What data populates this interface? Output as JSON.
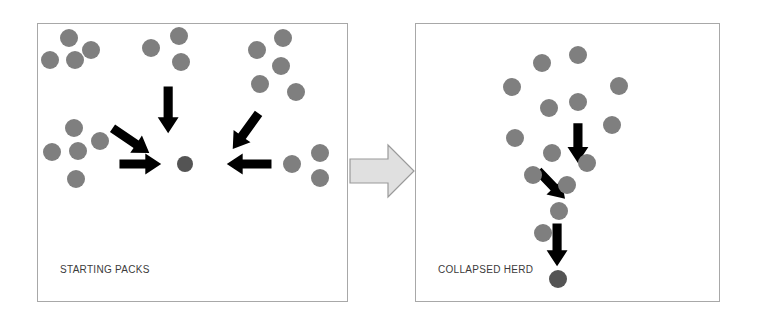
{
  "figure": {
    "type": "diagram",
    "background_color": "#ffffff",
    "dot_color": "#7f7f7f",
    "dark_dot_color": "#545454",
    "arrow_color": "#000000",
    "panel_border_color": "#a8a8a8",
    "transition_arrow_fill": "#e0e0e0",
    "transition_arrow_stroke": "#9a9a9a"
  },
  "panels": {
    "left": {
      "label": "STARTING PACKS",
      "packs": [
        {
          "name": "top-left-pack",
          "count": 4,
          "dots": [
            {
              "x": 31,
              "y": 14,
              "r": 9
            },
            {
              "x": 53,
              "y": 26,
              "r": 9
            },
            {
              "x": 12,
              "y": 36,
              "r": 9
            },
            {
              "x": 37,
              "y": 36,
              "r": 9
            }
          ]
        },
        {
          "name": "top-middle-pack",
          "count": 3,
          "dots": [
            {
              "x": 113,
              "y": 24,
              "r": 9
            },
            {
              "x": 141,
              "y": 12,
              "r": 9
            },
            {
              "x": 143,
              "y": 38,
              "r": 9
            }
          ]
        },
        {
          "name": "top-right-pack",
          "count": 5,
          "dots": [
            {
              "x": 219,
              "y": 26,
              "r": 9
            },
            {
              "x": 245,
              "y": 14,
              "r": 9
            },
            {
              "x": 243,
              "y": 42,
              "r": 9
            },
            {
              "x": 222,
              "y": 60,
              "r": 9
            },
            {
              "x": 258,
              "y": 68,
              "r": 9
            }
          ]
        },
        {
          "name": "bottom-left-pack",
          "count": 5,
          "dots": [
            {
              "x": 36,
              "y": 104,
              "r": 9
            },
            {
              "x": 62,
              "y": 117,
              "r": 9
            },
            {
              "x": 14,
              "y": 128,
              "r": 9
            },
            {
              "x": 40,
              "y": 127,
              "r": 9
            },
            {
              "x": 38,
              "y": 155,
              "r": 9
            }
          ]
        },
        {
          "name": "right-middle-pack",
          "count": 3,
          "dots": [
            {
              "x": 254,
              "y": 140,
              "r": 9
            },
            {
              "x": 282,
              "y": 129,
              "r": 9
            },
            {
              "x": 282,
              "y": 154,
              "r": 9
            }
          ]
        }
      ],
      "center_dot": {
        "x": 147,
        "y": 140,
        "r": 8
      },
      "arrows": [
        {
          "name": "arrow-top-left",
          "x1": 75,
          "y1": 105,
          "x2": 112,
          "y2": 130
        },
        {
          "name": "arrow-top-middle",
          "x1": 131,
          "y1": 63,
          "x2": 131,
          "y2": 110
        },
        {
          "name": "arrow-top-right",
          "x1": 222,
          "y1": 90,
          "x2": 196,
          "y2": 126
        },
        {
          "name": "arrow-left",
          "x1": 82,
          "y1": 141,
          "x2": 124,
          "y2": 141
        },
        {
          "name": "arrow-right",
          "x1": 235,
          "y1": 141,
          "x2": 190,
          "y2": 141
        }
      ]
    },
    "right": {
      "label": "COLLAPSED HERD",
      "herd_dots": [
        {
          "x": 126,
          "y": 39,
          "r": 9
        },
        {
          "x": 162,
          "y": 31,
          "r": 9
        },
        {
          "x": 96,
          "y": 63,
          "r": 9
        },
        {
          "x": 203,
          "y": 62,
          "r": 9
        },
        {
          "x": 133,
          "y": 84,
          "r": 9
        },
        {
          "x": 162,
          "y": 78,
          "r": 9
        },
        {
          "x": 196,
          "y": 101,
          "r": 9
        },
        {
          "x": 99,
          "y": 114,
          "r": 9
        },
        {
          "x": 136,
          "y": 129,
          "r": 9
        },
        {
          "x": 171,
          "y": 139,
          "r": 9
        },
        {
          "x": 117,
          "y": 151,
          "r": 9
        },
        {
          "x": 151,
          "y": 161,
          "r": 9
        },
        {
          "x": 143,
          "y": 187,
          "r": 9
        },
        {
          "x": 127,
          "y": 209,
          "r": 9
        }
      ],
      "lead_dot": {
        "x": 142,
        "y": 255,
        "r": 9
      },
      "arrows": [
        {
          "name": "arrow-herd-upper",
          "x1": 163,
          "y1": 100,
          "x2": 163,
          "y2": 140
        },
        {
          "name": "arrow-herd-mid",
          "x1": 123,
          "y1": 148,
          "x2": 150,
          "y2": 176
        },
        {
          "name": "arrow-herd-lower",
          "x1": 142,
          "y1": 201,
          "x2": 142,
          "y2": 244
        }
      ]
    }
  },
  "transition": {
    "name": "transition-arrow",
    "direction": "right"
  }
}
